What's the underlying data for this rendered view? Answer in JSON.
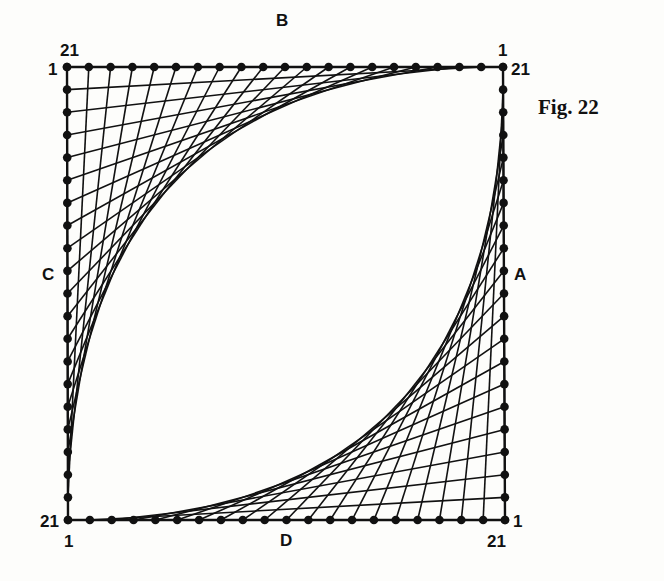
{
  "figure": {
    "caption": "Fig. 22",
    "points_per_side": 21,
    "colors": {
      "ink": "#111111",
      "background": "#fdfdfb"
    },
    "square": {
      "top_left": [
        67,
        67
      ],
      "top_right": [
        503,
        67
      ],
      "bottom_right": [
        505,
        520
      ],
      "bottom_left": [
        68,
        520
      ]
    },
    "sides": {
      "A": {
        "label": "A",
        "edge": "right",
        "numbering": "21 at top, 1 at bottom"
      },
      "B": {
        "label": "B",
        "edge": "top",
        "numbering": "21 at left, 1 at right"
      },
      "C": {
        "label": "C",
        "edge": "left",
        "numbering": "1 at top, 21 at bottom"
      },
      "D": {
        "label": "D",
        "edge": "bottom",
        "numbering": "1 at left, 21 at right"
      }
    },
    "string_sets": [
      {
        "name": "top-left-envelope",
        "from_side": "C",
        "to_side": "B",
        "rule": "join point i on C to point i on B"
      },
      {
        "name": "bottom-right-envelope",
        "from_side": "A",
        "to_side": "D",
        "rule": "join point i on A to point i on D"
      }
    ],
    "corner_labels": {
      "top_left_outer": "21",
      "top_left_inner": "1",
      "top_right_outer": "1",
      "top_right_inner": "21",
      "bottom_left_outer": "21",
      "bottom_left_inner": "1",
      "bottom_right_outer": "1",
      "bottom_right_inner": "21"
    }
  }
}
